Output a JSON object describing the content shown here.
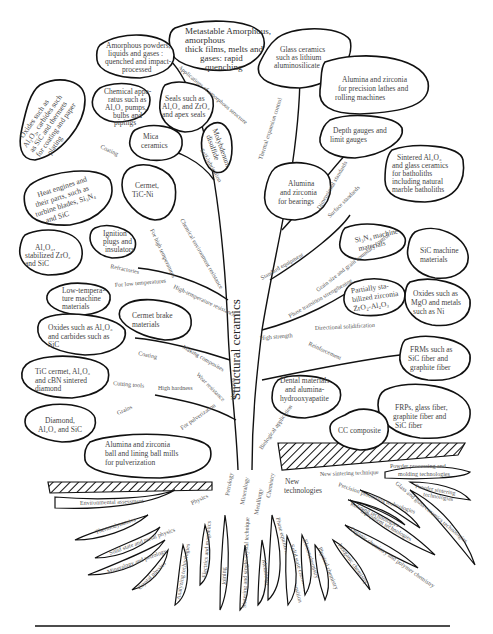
{
  "diagram": {
    "title": "Structural ceramics",
    "nodes": {
      "metastable": [
        "Metastable Amorphous,",
        "amorphous",
        "thick films, melts and",
        "gases: rapid",
        "quenching"
      ],
      "amorphous_powders": [
        "Amorphous powders,",
        "liquids and gases :",
        "quenched and impact-",
        "processed"
      ],
      "glass_ceramics": [
        "Glass ceramics",
        "such as lithium",
        "aluminosilicate"
      ],
      "alumina_precision": [
        "Alumina and zirconia",
        "for precision lathes and",
        "rolling machines"
      ],
      "oxides_coating": [
        "Oxides such as",
        "Al₂O₃, carbides such",
        "as SiC and thermets",
        "for coating and paper",
        "plating"
      ],
      "chemical_apparatus": [
        "Chemical appa-",
        "ratus such as",
        "Al₂O₃ pumps,",
        "bulbs and",
        "pipings"
      ],
      "seals": [
        "Seals such as",
        "Al₂O₃ and ZrO₂",
        "and apex seals"
      ],
      "mica": [
        "Mica",
        "ceramics"
      ],
      "molybdenum": [
        "Molybdenum",
        "disulfide"
      ],
      "depth_gauges": [
        "Depth gauges and",
        "limit gauges"
      ],
      "sintered_al2o3": [
        "Sintered Al₂O₃",
        "and glass ceramics",
        "for batholiths",
        "including natural",
        "marble batholiths"
      ],
      "heat_engines": [
        "Heat engines and",
        "their parts, such as",
        "turbine blades, Si₃N₄",
        "and SiC"
      ],
      "cermet_tic": [
        "Cermet,",
        "TiC-Ni"
      ],
      "alumina_bearings": [
        "Alumina",
        "and zirconia",
        "for bearings"
      ],
      "ignition": [
        "Ignition",
        "plugs and",
        "insulators"
      ],
      "al2o3_stab": [
        "Al₂O₃,",
        "stabilized ZrO₂",
        "and SiC"
      ],
      "si3n4_machine": [
        "Si₃N₄ machine",
        "materials"
      ],
      "sic_machine": [
        "SiC machine",
        "materials"
      ],
      "low_temp": [
        "Low-tempera-",
        "ture machine",
        "materials"
      ],
      "cermet_brake": [
        "Cermet brake",
        "materials"
      ],
      "partially_stab": [
        "Partially sta-",
        "bilized zirconia",
        "ZrO₂-Al₂O₃"
      ],
      "oxides_mgo": [
        "Oxides such as",
        "MgO and metals",
        "such as Ni"
      ],
      "oxides_al2o3_carbides": [
        "Oxides such as Al₂O₃",
        "and carbides such as",
        "SiC"
      ],
      "tic_cermet": [
        "TiC cermet, Al₂O₃",
        "and cBN sintered",
        "diamond"
      ],
      "frms": [
        "FRMs such as",
        "SiC fiber and",
        "graphite fiber"
      ],
      "dental": [
        "Dental materials",
        "and alumina-",
        "hydrooxyapatite"
      ],
      "frps": [
        "FRPs, glass fiber,",
        "graphite fiber and",
        "SiC fiber"
      ],
      "diamond": [
        "Diamond,",
        "Al₂O₃ and SiC"
      ],
      "cc_composite": [
        "CC composite"
      ],
      "alumina_ball": [
        "Alumina and zirconia",
        "ball and lining ball mills",
        "for pulverization"
      ]
    },
    "branch_labels": {
      "applications_amorphous": "Applications of amorphous structure",
      "thermal_expansion": "Thermal expansion control",
      "coating_top": "Coating",
      "self_lubrication": "Self-lubrication",
      "chemical_env": "Chemical environment resistance",
      "for_high_temps": "For high temperatures",
      "refractories": "Refractories",
      "for_low_temps": "For low temperatures",
      "high_temp_resistance": "High-temperature resistance",
      "dimensional_standards": "Dimensional standards",
      "surface_standards": "Surface standards",
      "standard_equipment": "Standard equipment",
      "grain_size": "Grain size and grain boundary control",
      "phase_transition": "Phase transition strengthening",
      "directional_solid": "Directional solidification",
      "high_strength": "High strength",
      "reinforcement": "Reinforcement",
      "coating_mid": "Coating",
      "making_composites": "Making composites",
      "cutting_tools": "Cutting tools",
      "high_hardness": "High hardness",
      "wear_resistance": "Wear resistance",
      "hardness": "Hardness",
      "grains": "Grains",
      "for_pulverization": "For pulverization",
      "biological": "Biological application"
    },
    "roots": {
      "environmental": "Environmental assessment",
      "physics": "Physics",
      "petrology": "Petrology",
      "mineralogy": "Mineralogy",
      "metallurgy_top": "Metallurgy",
      "chemistry": "Chemistry",
      "new_technologies": [
        "New",
        "technologies"
      ],
      "thermodynamics": "Thermodynamics",
      "solid_state_physics": "Solid state and metal physics",
      "mineralogy_petrology": "Mineralogy and petrology",
      "crystal_physics": "Crystal physics",
      "analyzing": "Analyzing technologies",
      "electrics": "Electrics and magnetics",
      "joining": "Joining",
      "sintering_single": "Sintering and single-crystal technique",
      "metallurgy": "Metallurgy",
      "phase_equilibria": "Phase equilibria and phase transition",
      "solid_state_chem": "Solid state chemistry",
      "electrochemistry": "Electrochemistry",
      "physical_chem": "Physical chemistry",
      "inorganic_chem": "Inorganic chemistry",
      "organic_chem": "Organic chemistry and polymer chemistry",
      "equipment_tech": "Equipment technologies",
      "refining_tech": "Refining technologies",
      "precision_processing": "Precision processing technologies",
      "new_sintering": "New sintering technique",
      "glass_ceramics_tech": "Glass and glass-ceramics technologies",
      "powder_processing": [
        "Powder processing and",
        "molding technologies"
      ],
      "powder_sintering": [
        "Powder sintering",
        "technologies"
      ]
    }
  }
}
